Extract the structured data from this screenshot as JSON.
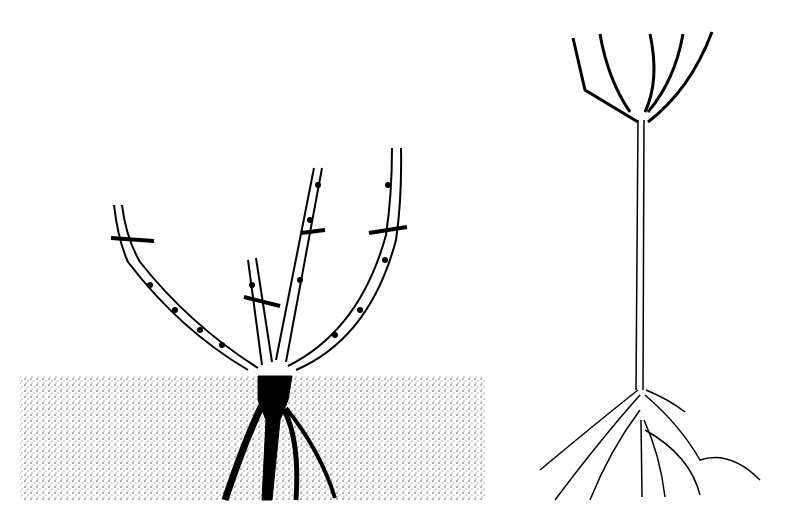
{
  "figure": {
    "background": "#ffffff",
    "ink": "#111111",
    "soil_color": "#8a8a8a"
  },
  "bush_rose": {
    "label": "Bush rose with pruning cuts",
    "canes": 4,
    "cut_marks": 4,
    "soil_box": {
      "x": 20,
      "y": 376,
      "w": 466,
      "h": 124
    }
  },
  "standard_rose": {
    "label": "Standard (tree) rose",
    "branches": 5
  }
}
